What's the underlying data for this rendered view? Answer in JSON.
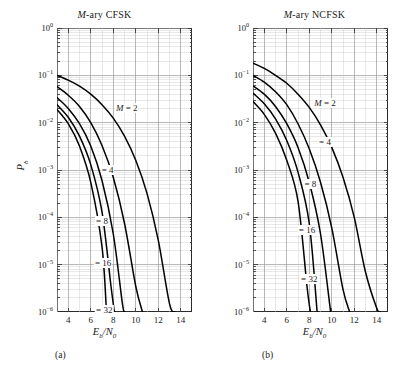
{
  "figure": {
    "background": "#ffffff",
    "ink": "#1a1a1a",
    "grid_minor_color": "#cccccc",
    "grid_major_color": "#9a9a9a",
    "curve_color": "#000000"
  },
  "panels": [
    {
      "id": "a",
      "title_italic": "M",
      "title_rest": "-ary CFSK",
      "subcaption": "(a)",
      "xlabel_main": "E",
      "xlabel_sub": "b",
      "xlabel_tail": "/N",
      "xlabel_sub2": "0",
      "ylabel_main": "P",
      "ylabel_sub": "b",
      "xticks": [
        "4",
        "6",
        "8",
        "10",
        "12",
        "14"
      ],
      "xtick_values": [
        4,
        6,
        8,
        10,
        12,
        14
      ],
      "yticks": [
        "0",
        "-1",
        "-2",
        "-3",
        "-4",
        "-5",
        "-6"
      ],
      "curve_labels": [
        {
          "text_italic": "M",
          "text": " = 2",
          "x": 9.2,
          "y": 0.02
        },
        {
          "text_italic": "",
          "text": "= 4",
          "x": 7.5,
          "y": 0.001
        },
        {
          "text_italic": "",
          "text": "= 8",
          "x": 7.0,
          "y": 8.5e-05
        },
        {
          "text_italic": "",
          "text": "= 16",
          "x": 7.1,
          "y": 1.1e-05
        },
        {
          "text_italic": "",
          "text": "= 32",
          "x": 7.2,
          "y": 1.1e-06
        }
      ]
    },
    {
      "id": "b",
      "title_italic": "M",
      "title_rest": "-ary NCFSK",
      "subcaption": "(b)",
      "xlabel_main": "E",
      "xlabel_sub": "b",
      "xlabel_tail": "/N",
      "xlabel_sub2": "0",
      "ylabel_main": "P",
      "ylabel_sub": "b",
      "xticks": [
        "4",
        "6",
        "8",
        "10",
        "12",
        "14"
      ],
      "xtick_values": [
        4,
        6,
        8,
        10,
        12,
        14
      ],
      "yticks": [
        "0",
        "-1",
        "-2",
        "-3",
        "-4",
        "-5",
        "-6"
      ],
      "curve_labels": [
        {
          "text_italic": "M",
          "text": " = 2",
          "x": 9.4,
          "y": 0.026
        },
        {
          "text_italic": "",
          "text": "= 4",
          "x": 9.4,
          "y": 0.004
        },
        {
          "text_italic": "",
          "text": "= 8",
          "x": 8.1,
          "y": 0.0005
        },
        {
          "text_italic": "",
          "text": "= 16",
          "x": 7.8,
          "y": 5.5e-05
        },
        {
          "text_italic": "",
          "text": "= 32",
          "x": 8.0,
          "y": 5e-06
        }
      ]
    }
  ],
  "chart_data": {
    "type": "line",
    "xlabel": "Eb/N0",
    "ylabel": "Pb",
    "xlim": [
      3,
      15
    ],
    "ylim": [
      1e-06,
      1
    ],
    "yscale": "log",
    "grid": true,
    "legend_position": "inline-curve-labels",
    "charts": [
      {
        "subplot": "(a)",
        "title": "M-ary CFSK",
        "series": [
          {
            "name": "M = 2",
            "x": [
              3.0,
              4.0,
              5.0,
              6.0,
              7.0,
              8.0,
              9.0,
              10.0,
              11.0,
              12.0,
              13.0,
              13.5
            ],
            "y": [
              0.1,
              0.079,
              0.059,
              0.04,
              0.024,
              0.0125,
              0.0052,
              0.0016,
              0.00032,
              3.3e-05,
              1.5e-06,
              1e-06
            ]
          },
          {
            "name": "M = 4",
            "x": [
              3.0,
              4.0,
              5.0,
              6.0,
              7.0,
              8.0,
              9.0,
              10.0,
              10.6
            ],
            "y": [
              0.058,
              0.038,
              0.022,
              0.01,
              0.0033,
              0.0007,
              7.5e-05,
              3.5e-06,
              1e-06
            ]
          },
          {
            "name": "M = 8",
            "x": [
              3.0,
              4.0,
              5.0,
              6.0,
              7.0,
              8.0,
              8.8,
              9.0
            ],
            "y": [
              0.034,
              0.02,
              0.0095,
              0.0032,
              0.0006,
              4.5e-05,
              1.6e-06,
              1e-06
            ]
          },
          {
            "name": "M = 16",
            "x": [
              3.0,
              4.0,
              5.0,
              6.0,
              7.0,
              7.8,
              8.1
            ],
            "y": [
              0.024,
              0.013,
              0.0052,
              0.0013,
              0.00013,
              3.5e-06,
              1e-06
            ]
          },
          {
            "name": "M = 32",
            "x": [
              3.0,
              4.0,
              5.0,
              6.0,
              7.0,
              7.4
            ],
            "y": [
              0.019,
              0.0095,
              0.0032,
              0.00055,
              2.4e-05,
              1e-06
            ]
          }
        ]
      },
      {
        "subplot": "(b)",
        "title": "M-ary NCFSK",
        "series": [
          {
            "name": "M = 2",
            "x": [
              3.0,
              4.0,
              5.0,
              6.0,
              7.0,
              8.0,
              9.0,
              10.0,
              11.0,
              12.0,
              13.0,
              14.0,
              14.3
            ],
            "y": [
              0.18,
              0.14,
              0.1,
              0.068,
              0.04,
              0.021,
              0.009,
              0.003,
              0.0007,
              0.0001,
              7e-06,
              1.2e-06,
              1e-06
            ]
          },
          {
            "name": "M = 4",
            "x": [
              3.0,
              4.0,
              5.0,
              6.0,
              7.0,
              8.0,
              9.0,
              10.0,
              11.0,
              11.6
            ],
            "y": [
              0.1,
              0.072,
              0.045,
              0.024,
              0.0095,
              0.0028,
              0.00055,
              6e-05,
              3e-06,
              1e-06
            ]
          },
          {
            "name": "M = 8",
            "x": [
              3.0,
              4.0,
              5.0,
              6.0,
              7.0,
              8.0,
              9.0,
              9.9
            ],
            "y": [
              0.06,
              0.04,
              0.022,
              0.0095,
              0.003,
              0.00055,
              4.5e-05,
              1e-06
            ]
          },
          {
            "name": "M = 16",
            "x": [
              3.0,
              4.0,
              5.0,
              6.0,
              7.0,
              8.0,
              8.7
            ],
            "y": [
              0.042,
              0.025,
              0.012,
              0.0042,
              0.0009,
              7.5e-05,
              1e-06
            ]
          },
          {
            "name": "M = 32",
            "x": [
              3.0,
              4.0,
              5.0,
              6.0,
              7.0,
              7.8,
              8.1
            ],
            "y": [
              0.028,
              0.015,
              0.006,
              0.0016,
              0.00022,
              3.5e-06,
              1e-06
            ]
          }
        ]
      }
    ]
  }
}
